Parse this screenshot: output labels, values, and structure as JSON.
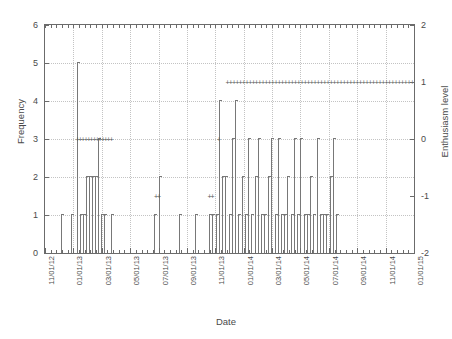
{
  "chart_data": {
    "type": "bar",
    "title": "",
    "xlabel": "Date",
    "ylabel": "Frequency",
    "y2label": "Enthusiasm level",
    "grid": true,
    "legend": "none",
    "xlim": [
      "11/01/12",
      "01/01/15"
    ],
    "ylim": [
      0,
      6
    ],
    "y2lim": [
      -2,
      2
    ],
    "yticks": [
      "0",
      "1",
      "2",
      "3",
      "4",
      "5",
      "6"
    ],
    "y2ticks": [
      "-2",
      "-1",
      "0",
      "1",
      "2"
    ],
    "xticks": [
      "11/01/12",
      "01/01/13",
      "03/01/13",
      "05/01/13",
      "07/01/13",
      "09/01/13",
      "11/01/13",
      "01/01/14",
      "03/01/14",
      "05/01/14",
      "07/01/14",
      "09/01/14",
      "11/01/14",
      "01/01/15"
    ],
    "series": [
      {
        "name": "Frequency",
        "axis": "left",
        "type": "impulse",
        "points": [
          {
            "x": 4.0,
            "y": 1
          },
          {
            "x": 6.5,
            "y": 1
          },
          {
            "x": 8.0,
            "y": 5
          },
          {
            "x": 8.6,
            "y": 1
          },
          {
            "x": 9.4,
            "y": 1
          },
          {
            "x": 10.2,
            "y": 2
          },
          {
            "x": 10.9,
            "y": 2
          },
          {
            "x": 11.6,
            "y": 2
          },
          {
            "x": 12.3,
            "y": 2
          },
          {
            "x": 13.0,
            "y": 3
          },
          {
            "x": 13.7,
            "y": 1
          },
          {
            "x": 14.5,
            "y": 1
          },
          {
            "x": 16.2,
            "y": 1
          },
          {
            "x": 27.0,
            "y": 1
          },
          {
            "x": 28.0,
            "y": 2
          },
          {
            "x": 33.0,
            "y": 1
          },
          {
            "x": 37.0,
            "y": 1
          },
          {
            "x": 40.5,
            "y": 1
          },
          {
            "x": 41.3,
            "y": 1
          },
          {
            "x": 42.1,
            "y": 1
          },
          {
            "x": 42.9,
            "y": 4
          },
          {
            "x": 43.7,
            "y": 2
          },
          {
            "x": 44.5,
            "y": 2
          },
          {
            "x": 45.3,
            "y": 1
          },
          {
            "x": 46.1,
            "y": 3
          },
          {
            "x": 46.9,
            "y": 4
          },
          {
            "x": 47.7,
            "y": 1
          },
          {
            "x": 48.5,
            "y": 2
          },
          {
            "x": 49.3,
            "y": 1
          },
          {
            "x": 50.1,
            "y": 3
          },
          {
            "x": 50.9,
            "y": 1
          },
          {
            "x": 51.7,
            "y": 2
          },
          {
            "x": 52.5,
            "y": 3
          },
          {
            "x": 53.3,
            "y": 1
          },
          {
            "x": 54.1,
            "y": 1
          },
          {
            "x": 55.0,
            "y": 2
          },
          {
            "x": 55.8,
            "y": 3
          },
          {
            "x": 56.6,
            "y": 1
          },
          {
            "x": 57.4,
            "y": 3
          },
          {
            "x": 58.2,
            "y": 1
          },
          {
            "x": 59.0,
            "y": 1
          },
          {
            "x": 59.8,
            "y": 2
          },
          {
            "x": 60.6,
            "y": 1
          },
          {
            "x": 61.4,
            "y": 3
          },
          {
            "x": 62.2,
            "y": 1
          },
          {
            "x": 63.0,
            "y": 3
          },
          {
            "x": 63.8,
            "y": 1
          },
          {
            "x": 64.6,
            "y": 1
          },
          {
            "x": 65.4,
            "y": 2
          },
          {
            "x": 66.2,
            "y": 1
          },
          {
            "x": 67.0,
            "y": 3
          },
          {
            "x": 67.8,
            "y": 1
          },
          {
            "x": 68.6,
            "y": 1
          },
          {
            "x": 69.4,
            "y": 1
          },
          {
            "x": 70.2,
            "y": 2
          },
          {
            "x": 71.0,
            "y": 3
          },
          {
            "x": 71.8,
            "y": 1
          }
        ]
      },
      {
        "name": "Enthusiasm level",
        "axis": "right",
        "type": "points",
        "marker": "plus",
        "points": [
          {
            "x": 8.0,
            "y": 0
          },
          {
            "x": 8.7,
            "y": 0
          },
          {
            "x": 9.4,
            "y": 0
          },
          {
            "x": 10.1,
            "y": 0
          },
          {
            "x": 10.8,
            "y": 0
          },
          {
            "x": 11.5,
            "y": 0
          },
          {
            "x": 12.2,
            "y": 0
          },
          {
            "x": 12.9,
            "y": 0
          },
          {
            "x": 13.6,
            "y": 0
          },
          {
            "x": 14.3,
            "y": 0
          },
          {
            "x": 15.0,
            "y": 0
          },
          {
            "x": 15.7,
            "y": 0
          },
          {
            "x": 16.4,
            "y": 0
          },
          {
            "x": 27.4,
            "y": -1
          },
          {
            "x": 28.1,
            "y": -1
          },
          {
            "x": 40.6,
            "y": -1
          },
          {
            "x": 41.3,
            "y": -1
          },
          {
            "x": 42.9,
            "y": 0
          },
          {
            "x": 45.0,
            "y": 1
          },
          {
            "x": 45.8,
            "y": 1
          },
          {
            "x": 46.6,
            "y": 1
          },
          {
            "x": 47.4,
            "y": 1
          },
          {
            "x": 48.2,
            "y": 1
          },
          {
            "x": 49.0,
            "y": 1
          },
          {
            "x": 49.8,
            "y": 1
          },
          {
            "x": 50.6,
            "y": 1
          },
          {
            "x": 51.4,
            "y": 1
          },
          {
            "x": 52.2,
            "y": 1
          },
          {
            "x": 53.0,
            "y": 1
          },
          {
            "x": 53.8,
            "y": 1
          },
          {
            "x": 54.6,
            "y": 1
          },
          {
            "x": 55.4,
            "y": 1
          },
          {
            "x": 56.2,
            "y": 1
          },
          {
            "x": 57.0,
            "y": 1
          },
          {
            "x": 57.8,
            "y": 1
          },
          {
            "x": 58.6,
            "y": 1
          },
          {
            "x": 59.4,
            "y": 1
          },
          {
            "x": 60.2,
            "y": 1
          },
          {
            "x": 61.0,
            "y": 1
          },
          {
            "x": 61.8,
            "y": 1
          },
          {
            "x": 62.6,
            "y": 1
          },
          {
            "x": 63.4,
            "y": 1
          },
          {
            "x": 64.2,
            "y": 1
          },
          {
            "x": 65.0,
            "y": 1
          },
          {
            "x": 65.8,
            "y": 1
          },
          {
            "x": 66.6,
            "y": 1
          },
          {
            "x": 67.4,
            "y": 1
          },
          {
            "x": 68.2,
            "y": 1
          },
          {
            "x": 69.0,
            "y": 1
          },
          {
            "x": 69.8,
            "y": 1
          },
          {
            "x": 70.6,
            "y": 1
          },
          {
            "x": 71.4,
            "y": 1
          },
          {
            "x": 72.2,
            "y": 1
          },
          {
            "x": 73.0,
            "y": 1
          },
          {
            "x": 73.8,
            "y": 1
          },
          {
            "x": 74.6,
            "y": 1
          },
          {
            "x": 75.4,
            "y": 1
          },
          {
            "x": 76.2,
            "y": 1
          },
          {
            "x": 77.0,
            "y": 1
          },
          {
            "x": 77.8,
            "y": 1
          },
          {
            "x": 78.6,
            "y": 1
          },
          {
            "x": 79.4,
            "y": 1
          },
          {
            "x": 80.2,
            "y": 1
          },
          {
            "x": 81.0,
            "y": 1
          },
          {
            "x": 81.8,
            "y": 1
          },
          {
            "x": 82.6,
            "y": 1
          },
          {
            "x": 83.4,
            "y": 1
          },
          {
            "x": 84.2,
            "y": 1
          },
          {
            "x": 85.0,
            "y": 1
          },
          {
            "x": 85.8,
            "y": 1
          },
          {
            "x": 86.6,
            "y": 1
          },
          {
            "x": 87.4,
            "y": 1
          },
          {
            "x": 88.2,
            "y": 1
          },
          {
            "x": 89.0,
            "y": 1
          },
          {
            "x": 89.8,
            "y": 1
          },
          {
            "x": 90.6,
            "y": 1
          }
        ]
      }
    ]
  },
  "colors": {
    "frame": "#6b6b6b",
    "grid": "#c3c3c3",
    "bar": "#787878",
    "text": "#4a4a4a",
    "background": "#ffffff"
  }
}
